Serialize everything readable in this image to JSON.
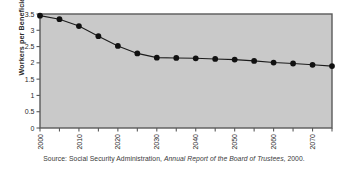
{
  "chart_data": {
    "type": "line",
    "title": "",
    "xlabel": "",
    "ylabel": "Workers per Beneficiary",
    "xlim": [
      2000,
      2075
    ],
    "ylim": [
      0,
      3.5
    ],
    "ytick_step": 0.5,
    "xtick_step": 5,
    "xlabel_step": 10,
    "grid": false,
    "legend": null,
    "marker": "filled-circle",
    "yticks": [
      "0",
      "0.5",
      "1",
      "1.5",
      "2",
      "2.5",
      "3",
      "3.5"
    ],
    "ytick_values": [
      0,
      0.5,
      1,
      1.5,
      2,
      2.5,
      3,
      3.5
    ],
    "xticks": [
      "2000",
      "2010",
      "2020",
      "2030",
      "2040",
      "2050",
      "2060",
      "2070"
    ],
    "xtick_values": [
      2000,
      2010,
      2020,
      2030,
      2040,
      2050,
      2060,
      2070
    ],
    "xminor_values": [
      2000,
      2005,
      2010,
      2015,
      2020,
      2025,
      2030,
      2035,
      2040,
      2045,
      2050,
      2055,
      2060,
      2065,
      2070,
      2075
    ],
    "x": [
      2000,
      2005,
      2010,
      2015,
      2020,
      2025,
      2030,
      2035,
      2040,
      2045,
      2050,
      2055,
      2060,
      2065,
      2070,
      2075
    ],
    "values": [
      3.45,
      3.34,
      3.13,
      2.82,
      2.52,
      2.29,
      2.16,
      2.15,
      2.14,
      2.12,
      2.1,
      2.06,
      2.01,
      1.98,
      1.94,
      1.9
    ]
  },
  "source": {
    "prefix": "Source: Social Security Administration,",
    "publication": "Annual Report of the Board of Trustees",
    "suffix": ", 2000."
  },
  "colors": {
    "plot_background": "#c9c9c9",
    "plot_border": "#5a5a5a",
    "line": "#1c1c1c",
    "marker": "#111111",
    "text": "#2b2b2b",
    "page_background": "#ffffff"
  }
}
